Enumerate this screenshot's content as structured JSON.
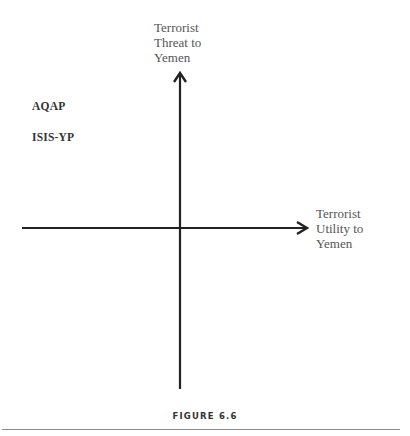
{
  "diagram": {
    "y_axis_label": [
      "Terrorist",
      "Threat to",
      "Yemen"
    ],
    "x_axis_label": [
      "Terrorist",
      "Utility to",
      "Yemen"
    ],
    "items": [
      "AQAP",
      "ISIS-YP"
    ],
    "caption": "FIGURE 6.6"
  },
  "colors": {
    "axis": "#222222",
    "label": "#555555",
    "rule": "#8a8a8a"
  }
}
